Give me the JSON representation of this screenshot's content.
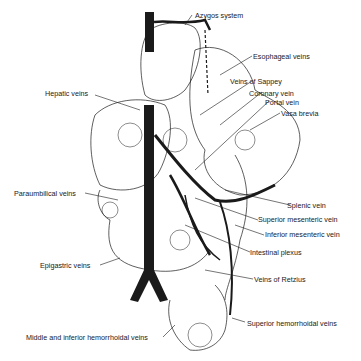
{
  "labels": {
    "azygos": "Azygos system",
    "esophageal": "Esophageal veins",
    "sappey": "Veins of Sappey",
    "coronary": "Coronary vein",
    "portal": "Portal vein",
    "vasa_brevia": "Vasa brevia",
    "hepatic": "Hepatic veins",
    "paraumbilical": "Paraumbilical veins",
    "splenic": "Splenic vein",
    "sup_mesenteric": "Superior mesenteric vein",
    "inf_mesenteric": "Inferior mesenteric vein",
    "intestinal": "Intestinal plexus",
    "epigastric": "Epigastric veins",
    "retzius": "Veins of Retzius",
    "mid_inf_hemorrhoidal": "Middle and inferior hemorrhoidal veins",
    "sup_hemorrhoidal": "Superior hemorrhoidal veins"
  },
  "colors": {
    "ink": "#1a1a1a",
    "background": "#ffffff"
  }
}
